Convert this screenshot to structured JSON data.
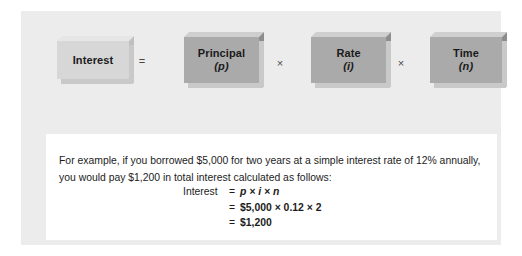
{
  "figure": {
    "equation": {
      "terms": [
        {
          "name": "interest",
          "label": "Interest",
          "symbol": "",
          "style": "light"
        },
        {
          "name": "principal",
          "label": "Principal",
          "symbol": "(p)",
          "style": "dark"
        },
        {
          "name": "rate",
          "label": "Rate",
          "symbol": "(i)",
          "style": "dark"
        },
        {
          "name": "time",
          "label": "Time",
          "symbol": "(n)",
          "style": "dark"
        }
      ],
      "operators": {
        "equals": "=",
        "times_first": "×",
        "times_second": "×"
      }
    },
    "example": {
      "paragraph": "For example, if you borrowed $5,000 for two years at a simple interest rate of 12% annually, you would pay $1,200 in total interest calculated as follows:",
      "formula": {
        "line1_label": "Interest",
        "line1_eq": "=",
        "line1_value": "p × i × n",
        "line2_label": "",
        "line2_eq": "=",
        "line2_value": "$5,000 × 0.12 × 2",
        "line3_label": "",
        "line3_eq": "=",
        "line3_value": "$1,200"
      }
    }
  },
  "colors": {
    "card_background": "#ececec",
    "panel_background": "#ffffff",
    "box_light": "#d7d7d7",
    "box_dark": "#aaaaaa",
    "text": "#1c1c1c"
  }
}
